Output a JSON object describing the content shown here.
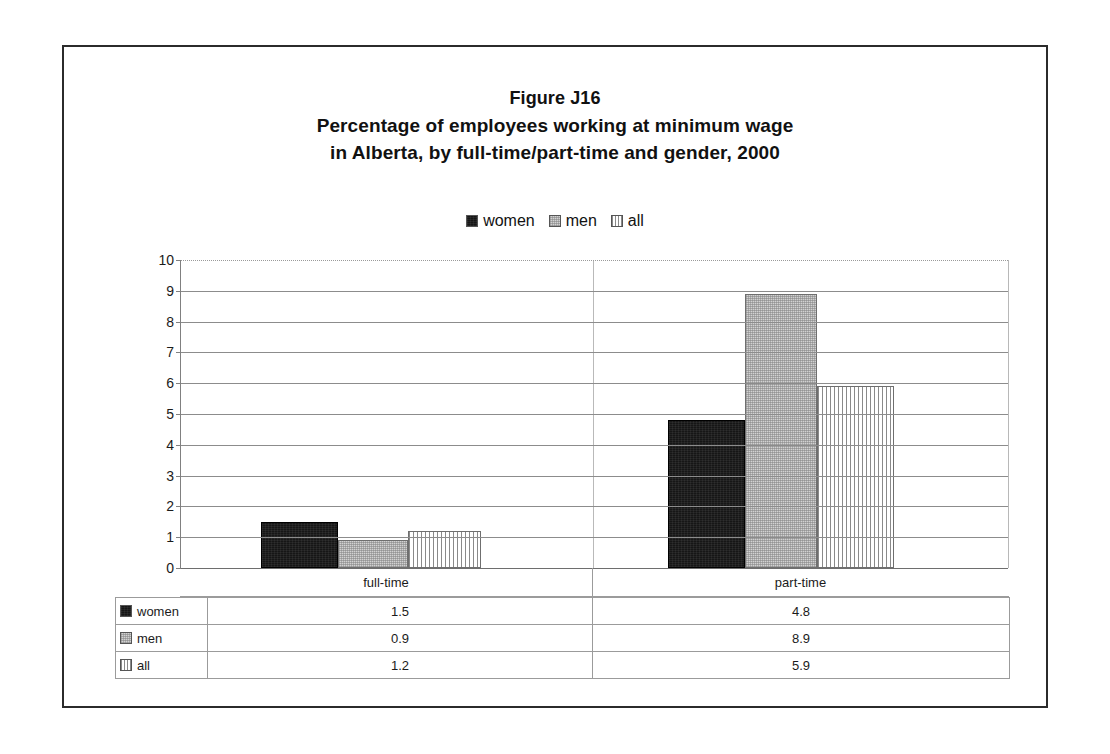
{
  "figure": {
    "title_lines": [
      "Figure J16",
      "Percentage of employees working at minimum wage",
      "in Alberta, by full-time/part-time and gender, 2000"
    ]
  },
  "legend": {
    "entries": [
      {
        "label": "women",
        "swatch": "solid-black-swatch"
      },
      {
        "label": "men",
        "swatch": "light-gray-swatch"
      },
      {
        "label": "all",
        "swatch": "vertical-stripe-swatch"
      }
    ]
  },
  "axis": {
    "y_ticks": [
      "10",
      "9",
      "8",
      "7",
      "6",
      "5",
      "4",
      "3",
      "2",
      "1",
      "0"
    ]
  },
  "table": {
    "column_headers": [
      "",
      "full-time",
      "part-time"
    ],
    "rows": [
      {
        "series": "women",
        "values": [
          "1.5",
          "4.8"
        ]
      },
      {
        "series": "men",
        "values": [
          "0.9",
          "8.9"
        ]
      },
      {
        "series": "all",
        "values": [
          "1.2",
          "5.9"
        ]
      }
    ]
  },
  "colors": {
    "women": "#161616",
    "men": "#d2d2d2",
    "all": "#ffffff",
    "stripe": "#8a8a8a",
    "frame": "#2b2b2b",
    "grid": "#8c8c8c"
  },
  "chart_data": {
    "type": "bar",
    "xlabel": "",
    "ylabel": "",
    "categories": [
      "full-time",
      "part-time"
    ],
    "series": [
      {
        "name": "women",
        "values": [
          1.5,
          4.8
        ]
      },
      {
        "name": "men",
        "values": [
          0.9,
          8.9
        ]
      },
      {
        "name": "all",
        "values": [
          1.2,
          5.9
        ]
      }
    ],
    "ylim": [
      0,
      10
    ],
    "ytick_step": 1,
    "grid": "horizontal",
    "legend_position": "top-center"
  }
}
